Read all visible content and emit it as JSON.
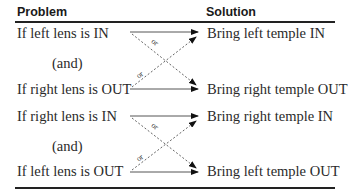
{
  "headers": {
    "problem": "Problem",
    "solution": "Solution"
  },
  "groups": [
    {
      "problem_top": "If left lens is IN",
      "connector": "(and)",
      "problem_bottom": "If right lens is OUT",
      "solution_top": "Bring left temple IN",
      "solution_bottom": "Bring right temple OUT",
      "cross_label_1": "or",
      "cross_label_2": "or"
    },
    {
      "problem_top": "If right lens is IN",
      "connector": "(and)",
      "problem_bottom": "If left lens is OUT",
      "solution_top": "Bring right temple IN",
      "solution_bottom": "Bring left temple OUT",
      "cross_label_1": "or",
      "cross_label_2": "or"
    }
  ]
}
